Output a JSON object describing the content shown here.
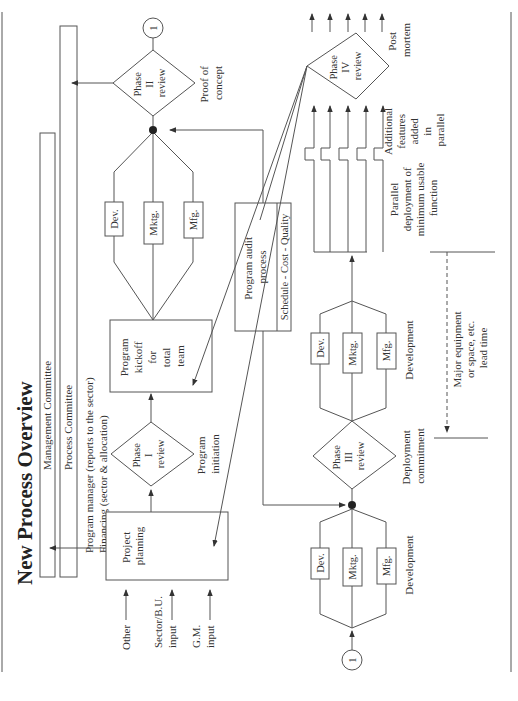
{
  "title": "New Process Overview",
  "bands": {
    "management": "Management Committee",
    "process": "Process Committee",
    "program_manager": "Program manager (reports to the sector)",
    "financing": "Financing (sector & allocation)"
  },
  "inputs": {
    "other": "Other",
    "sector": [
      "Sector/B.U.",
      "input"
    ],
    "gm": [
      "G.M.",
      "input"
    ]
  },
  "project_planning": [
    "Project",
    "planning"
  ],
  "phase1": {
    "label": [
      "Phase",
      "I",
      "review"
    ],
    "caption": [
      "Program",
      "initiation"
    ]
  },
  "kickoff": [
    "Program",
    "kickoff",
    "for",
    "total",
    "team"
  ],
  "teams": {
    "dev": "Dev.",
    "mktg": "Mktg.",
    "mfg": "Mfg."
  },
  "phase2": {
    "label": [
      "Phase",
      "II",
      "review"
    ],
    "caption": [
      "Proof of",
      "concept"
    ]
  },
  "connector": "1",
  "audit": {
    "label": [
      "Program audit",
      "process"
    ],
    "footer": "Schedule - Cost - Quality"
  },
  "dev1_caption": "Development",
  "phase3": {
    "label": [
      "Phase",
      "III",
      "review"
    ],
    "caption": [
      "Deployment",
      "commitment"
    ]
  },
  "dev2_caption": "Development",
  "lead_time": [
    "Major equipment",
    "or space, etc.",
    "lead time"
  ],
  "parallel": [
    "Parallel",
    "deployment of",
    "minimum usable",
    "function"
  ],
  "additional": [
    "Additional",
    "features",
    "added",
    "in",
    "parallel"
  ],
  "phase4": {
    "label": [
      "Phase",
      "IV",
      "review"
    ],
    "caption": [
      "Post",
      "mortem"
    ]
  }
}
